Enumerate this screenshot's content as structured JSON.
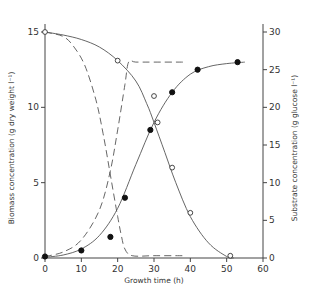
{
  "chart_data": {
    "type": "line",
    "title": "",
    "xlabel": "Growth time (h)",
    "ylabel": "Biomass concentration (g dry weight l⁻¹)",
    "y2label": "Substrate concentration (g glucose l⁻¹)",
    "xlim": [
      0,
      60
    ],
    "ylim": [
      0,
      15
    ],
    "y2lim": [
      0,
      30
    ],
    "xticks": [
      "0",
      "10",
      "20",
      "30",
      "40",
      "50",
      "60"
    ],
    "yticks": [
      "0",
      "5",
      "10",
      "15"
    ],
    "y2ticks": [
      "0",
      "5",
      "10",
      "15",
      "20",
      "25",
      "30"
    ],
    "grid": false,
    "legend": "none",
    "series": [
      {
        "name": "Biomass (measured)",
        "marker": "filled-circle",
        "axis": "left",
        "x": [
          0,
          10,
          18,
          22,
          29,
          35,
          42,
          53
        ],
        "values": [
          0.1,
          0.5,
          1.4,
          4.0,
          8.5,
          11.0,
          12.5,
          13.0
        ]
      },
      {
        "name": "Substrate (measured)",
        "marker": "open-circle",
        "axis": "right",
        "x": [
          0,
          20,
          30,
          31,
          35,
          40,
          51
        ],
        "values": [
          30,
          26.2,
          21.5,
          18.0,
          12.0,
          6.0,
          0.3
        ]
      },
      {
        "name": "Biomass (fitted, solid)",
        "style": "solid",
        "axis": "left",
        "x": [
          0,
          5,
          10,
          15,
          20,
          25,
          30,
          35,
          40,
          45,
          50,
          55
        ],
        "values": [
          0.05,
          0.2,
          0.6,
          1.5,
          3.3,
          6.2,
          9.0,
          11.0,
          12.2,
          12.7,
          12.9,
          13.0
        ]
      },
      {
        "name": "Substrate (fitted, solid)",
        "style": "solid",
        "axis": "right",
        "x": [
          0,
          5,
          10,
          15,
          20,
          25,
          28,
          30,
          33,
          36,
          40,
          45,
          50,
          52
        ],
        "values": [
          30,
          29.6,
          29.0,
          28.0,
          26.2,
          23.5,
          20.5,
          18.0,
          14.0,
          10.0,
          5.5,
          2.0,
          0.2,
          0
        ]
      },
      {
        "name": "Biomass (model, dashed)",
        "style": "dashed",
        "axis": "left",
        "x": [
          0,
          5,
          10,
          15,
          18,
          20,
          22,
          23,
          25,
          30,
          38
        ],
        "values": [
          0.1,
          0.4,
          1.2,
          3.2,
          5.8,
          8.5,
          11.5,
          13.0,
          13.0,
          13.0,
          13.0
        ]
      },
      {
        "name": "Substrate (model, dashed)",
        "style": "dashed",
        "axis": "right",
        "x": [
          0,
          5,
          8,
          11,
          14,
          16,
          18,
          20,
          21,
          22,
          24,
          30,
          38
        ],
        "values": [
          30,
          29.4,
          28.0,
          25.5,
          21.0,
          16.5,
          11.0,
          5.5,
          3.0,
          1.2,
          0.3,
          0.3,
          0.3
        ]
      }
    ]
  },
  "axes": {
    "x_title": "Growth time (h)",
    "y_title": "Biomass concentration (g dry weight l⁻¹)",
    "y2_title": "Substrate concentration (g glucose l⁻¹)"
  }
}
